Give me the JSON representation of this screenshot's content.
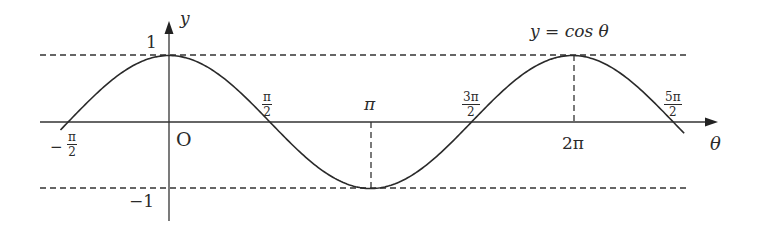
{
  "chart_data": {
    "type": "line",
    "title": "y = cos θ",
    "function": "cos",
    "xlabel": "θ",
    "ylabel": "y",
    "origin_label": "O",
    "x_ticks": [
      {
        "value": -1.5708,
        "label": "-π/2"
      },
      {
        "value": 1.5708,
        "label": "π/2"
      },
      {
        "value": 3.1416,
        "label": "π"
      },
      {
        "value": 4.7124,
        "label": "3π/2"
      },
      {
        "value": 6.2832,
        "label": "2π"
      },
      {
        "value": 7.854,
        "label": "5π/2"
      }
    ],
    "y_ticks": [
      {
        "value": 1,
        "label": "1"
      },
      {
        "value": -1,
        "label": "-1"
      }
    ],
    "xlim": [
      -1.5708,
      7.854
    ],
    "ylim": [
      -1,
      1
    ],
    "reference_lines": [
      {
        "type": "horizontal",
        "y": 1,
        "style": "dashed"
      },
      {
        "type": "horizontal",
        "y": -1,
        "style": "dashed"
      },
      {
        "type": "vertical",
        "x": 3.1416,
        "from": 0,
        "to": -1,
        "style": "dashed"
      },
      {
        "type": "vertical",
        "x": 6.2832,
        "from": 0,
        "to": 1,
        "style": "dashed"
      }
    ],
    "points": [
      {
        "x": -1.5708,
        "y": 0
      },
      {
        "x": 0,
        "y": 1
      },
      {
        "x": 1.5708,
        "y": 0
      },
      {
        "x": 3.1416,
        "y": -1
      },
      {
        "x": 4.7124,
        "y": 0
      },
      {
        "x": 6.2832,
        "y": 1
      },
      {
        "x": 7.854,
        "y": 0
      }
    ],
    "grid": false,
    "legend": null
  },
  "labels": {
    "equation": "y = cos θ",
    "y_axis": "y",
    "x_axis": "θ",
    "origin": "O",
    "y_one": "1",
    "y_neg_one": "−1",
    "neg_half_pi_num": "π",
    "neg_half_pi_den": "2",
    "neg_sign": "−",
    "half_pi_num": "π",
    "half_pi_den": "2",
    "pi": "π",
    "three_half_pi_num": "3π",
    "three_half_pi_den": "2",
    "two_pi": "2π",
    "five_half_pi_num": "5π",
    "five_half_pi_den": "2"
  },
  "style": {
    "line_color": "#2a2a2a",
    "dash_color": "#333333",
    "background": "#ffffff"
  }
}
